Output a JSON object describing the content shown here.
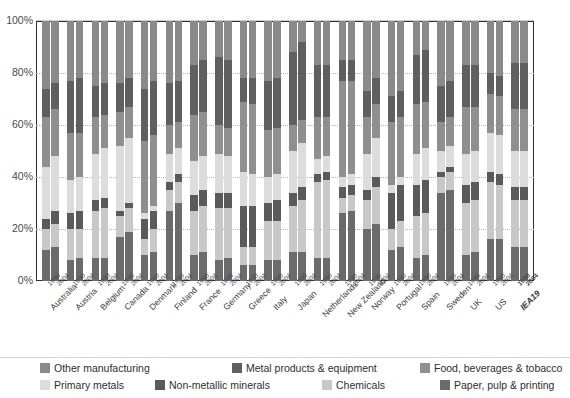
{
  "chart_data": {
    "type": "bar",
    "stacked": true,
    "normalized_percent": true,
    "title": "",
    "xlabel": "",
    "ylabel": "",
    "ylim": [
      0,
      100
    ],
    "ytick_labels": [
      "0%",
      "20%",
      "40%",
      "60%",
      "80%",
      "100%"
    ],
    "ytick_values": [
      0,
      20,
      40,
      60,
      80,
      100
    ],
    "grid": true,
    "legend_position": "bottom",
    "categories": [
      "Australia",
      "Austria",
      "Belgium",
      "Canada",
      "Denmark",
      "Finland",
      "France",
      "Germany",
      "Greece",
      "Italy",
      "Japan",
      "Netherlands",
      "New Zealand",
      "Norway",
      "Portugal",
      "Spain",
      "Sweden",
      "UK",
      "US",
      "IEA19"
    ],
    "sub_categories": [
      "1990",
      "2004"
    ],
    "series": [
      {
        "name": "Paper, pulp & printing",
        "color": "#6b6b6b",
        "values_1990": [
          12,
          8,
          9,
          17,
          10,
          27,
          10,
          8,
          6,
          8,
          11,
          9,
          26,
          20,
          12,
          9,
          34,
          10,
          16,
          13
        ],
        "values_2004": [
          13,
          9,
          9,
          19,
          11,
          30,
          11,
          9,
          6,
          8,
          11,
          9,
          27,
          22,
          13,
          10,
          35,
          11,
          16,
          13
        ]
      },
      {
        "name": "Chemicals",
        "color": "#c8c8c8",
        "values_1990": [
          8,
          12,
          18,
          8,
          6,
          8,
          17,
          20,
          7,
          15,
          18,
          29,
          6,
          11,
          8,
          16,
          6,
          20,
          22,
          18
        ],
        "values_2004": [
          9,
          11,
          19,
          9,
          9,
          8,
          18,
          19,
          7,
          15,
          20,
          30,
          6,
          14,
          10,
          16,
          7,
          20,
          21,
          18
        ]
      },
      {
        "name": "Non-metallic minerals",
        "color": "#5a5a5a",
        "values_1990": [
          4,
          6,
          4,
          2,
          8,
          3,
          6,
          6,
          16,
          7,
          5,
          3,
          4,
          4,
          14,
          12,
          2,
          7,
          4,
          5
        ],
        "values_2004": [
          5,
          7,
          4,
          2,
          7,
          3,
          6,
          6,
          16,
          8,
          5,
          3,
          4,
          4,
          14,
          13,
          2,
          7,
          4,
          5
        ]
      },
      {
        "name": "Primary metals",
        "color": "#dcdcdc",
        "values_1990": [
          20,
          13,
          18,
          25,
          2,
          11,
          13,
          15,
          13,
          10,
          16,
          6,
          4,
          14,
          3,
          12,
          8,
          12,
          15,
          14
        ],
        "values_2004": [
          21,
          13,
          19,
          25,
          2,
          10,
          13,
          14,
          12,
          10,
          17,
          6,
          4,
          15,
          3,
          12,
          8,
          12,
          15,
          14
        ]
      },
      {
        "name": "Metal products & equipment",
        "color": "#5f5f5f",
        "values_1990": [
          11,
          20,
          12,
          11,
          20,
          16,
          19,
          26,
          9,
          19,
          28,
          20,
          8,
          10,
          10,
          19,
          14,
          16,
          8,
          18
        ],
        "values_2004": [
          10,
          21,
          12,
          11,
          21,
          16,
          20,
          26,
          10,
          19,
          30,
          20,
          8,
          10,
          10,
          20,
          14,
          16,
          8,
          18
        ]
      },
      {
        "name": "Food, beverages & tobacco",
        "color": "#8f8f8f",
        "values_1990": [
          19,
          18,
          14,
          13,
          28,
          11,
          18,
          11,
          27,
          18,
          10,
          16,
          37,
          14,
          24,
          19,
          11,
          18,
          15,
          16
        ],
        "values_2004": [
          18,
          17,
          13,
          12,
          27,
          10,
          17,
          11,
          27,
          18,
          9,
          15,
          36,
          13,
          23,
          18,
          11,
          17,
          15,
          16
        ]
      },
      {
        "name": "Other manufacturing",
        "color": "#8a8a8a",
        "values_1990": [
          26,
          23,
          25,
          24,
          26,
          24,
          17,
          14,
          22,
          23,
          12,
          17,
          15,
          27,
          29,
          13,
          25,
          17,
          20,
          16
        ],
        "values_2004": [
          24,
          22,
          24,
          22,
          23,
          23,
          15,
          15,
          22,
          22,
          8,
          17,
          15,
          22,
          27,
          11,
          23,
          17,
          21,
          16
        ]
      }
    ],
    "legend_order": [
      "Other manufacturing",
      "Metal products & equipment",
      "Food, beverages & tobacco",
      "Primary metals",
      "Non-metallic minerals",
      "Chemicals",
      "Paper, pulp & printing"
    ]
  },
  "legend": {
    "row1": [
      {
        "label": "Other manufacturing",
        "color": "#8a8a8a",
        "left": 40
      },
      {
        "label": "Metal products & equipment",
        "color": "#5f5f5f",
        "left": 232
      },
      {
        "label": "Food, beverages & tobacco",
        "color": "#8f8f8f",
        "left": 420
      }
    ],
    "row2": [
      {
        "label": "Primary metals",
        "color": "#dcdcdc",
        "left": 40
      },
      {
        "label": "Non-metallic minerals",
        "color": "#5a5a5a",
        "left": 155
      },
      {
        "label": "Chemicals",
        "color": "#c8c8c8",
        "left": 322
      },
      {
        "label": "Paper, pulp & printing",
        "color": "#6b6b6b",
        "left": 440
      }
    ]
  },
  "axis": {
    "y_labels": [
      "100%",
      "80%",
      "60%",
      "40%",
      "20%",
      "0%"
    ]
  }
}
